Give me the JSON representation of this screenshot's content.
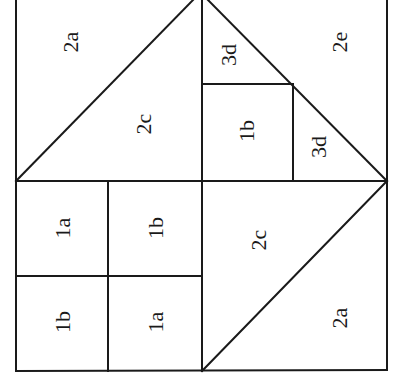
{
  "diagram": {
    "type": "quilt-block-piece-layout",
    "stroke_color": "#1a1a1a",
    "background": "#ffffff",
    "label_rotation_deg": -90,
    "pieces": [
      {
        "id": "top-left-upper",
        "label": "2a",
        "x": 70,
        "y": 42
      },
      {
        "id": "top-left-lower",
        "label": "2c",
        "x": 143,
        "y": 124
      },
      {
        "id": "top-right-small-tri-top",
        "label": "3d",
        "x": 228,
        "y": 55
      },
      {
        "id": "top-right-large",
        "label": "2e",
        "x": 339,
        "y": 42
      },
      {
        "id": "top-right-square",
        "label": "1b",
        "x": 246,
        "y": 131
      },
      {
        "id": "top-right-small-tri-bottom",
        "label": "3d",
        "x": 318,
        "y": 147
      },
      {
        "id": "bottom-left-tl",
        "label": "1a",
        "x": 62,
        "y": 228
      },
      {
        "id": "bottom-left-tr",
        "label": "1b",
        "x": 155,
        "y": 228
      },
      {
        "id": "bottom-left-bl",
        "label": "1b",
        "x": 62,
        "y": 322
      },
      {
        "id": "bottom-left-br",
        "label": "1a",
        "x": 155,
        "y": 322
      },
      {
        "id": "bottom-right-upper",
        "label": "2c",
        "x": 258,
        "y": 240
      },
      {
        "id": "bottom-right-lower",
        "label": "2a",
        "x": 339,
        "y": 318
      }
    ]
  }
}
